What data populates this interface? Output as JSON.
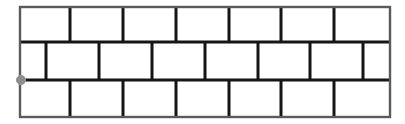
{
  "canvas": {
    "width": 405,
    "height": 124,
    "background_color": "#ffffff"
  },
  "diagram": {
    "name": "brick-wall",
    "wall": {
      "x": 20,
      "y": 7,
      "width": 370,
      "height": 110,
      "outer_border_color": "#5a5a5a",
      "outer_border_width": 2.4,
      "mortar_line_color": "#151515",
      "mortar_line_width": 3.0,
      "brick_fill_color": "#ffffff"
    },
    "rows": [
      {
        "index": 0,
        "name": "top-course",
        "y_top": 7,
        "y_bottom": 42,
        "offset": "flush",
        "brick_count": 7,
        "joint_x": [
          70,
          123,
          176,
          229,
          281,
          334
        ]
      },
      {
        "index": 1,
        "name": "middle-course",
        "y_top": 42,
        "y_bottom": 80,
        "offset": "half-brick",
        "brick_count": 8,
        "joint_x": [
          46,
          99,
          152,
          205,
          258,
          310,
          363
        ]
      },
      {
        "index": 2,
        "name": "bottom-course",
        "y_top": 80,
        "y_bottom": 117,
        "offset": "flush",
        "brick_count": 7,
        "joint_x": [
          70,
          123,
          176,
          229,
          281,
          334
        ]
      }
    ],
    "row_divider_y": [
      42,
      80
    ],
    "marker": {
      "name": "origin-point-marker",
      "x": 21,
      "y": 80,
      "radius": 4.6,
      "fill_color": "#8d8d8d",
      "edge_color": "#9a9a9a",
      "label": ""
    }
  },
  "chart_data": {
    "type": "diagram",
    "title": "",
    "pattern": "running bond",
    "courses": 3,
    "bricks_per_course": [
      7,
      8,
      7
    ],
    "brick_width": 53,
    "course_heights": [
      35,
      38,
      37
    ]
  }
}
